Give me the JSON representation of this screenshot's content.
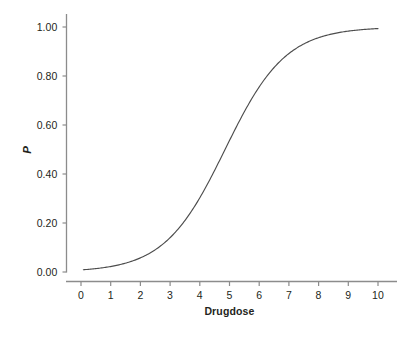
{
  "chart_data": {
    "type": "line",
    "title": "",
    "subtitle": "",
    "xlabel": "Drugdose",
    "ylabel": "P",
    "xlim": [
      -0.35,
      10.55
    ],
    "ylim": [
      -0.045,
      1.045
    ],
    "xticks": [
      0,
      1,
      2,
      3,
      4,
      5,
      6,
      7,
      8,
      9,
      10
    ],
    "xticklabels": [
      "0",
      "1",
      "2",
      "3",
      "4",
      "5",
      "6",
      "7",
      "8",
      "9",
      "10"
    ],
    "yticks": [
      0.0,
      0.2,
      0.4,
      0.6,
      0.8,
      1.0
    ],
    "yticklabels": [
      "0.00",
      "0.20",
      "0.40",
      "0.60",
      "0.80",
      "1.00"
    ],
    "grid": false,
    "legend": "none",
    "series": [
      {
        "name": "logistic response",
        "color": "#4d4d4d",
        "line_width": 1.0,
        "x": [
          0.08,
          0.3,
          0.6,
          0.9,
          1.2,
          1.5,
          1.8,
          2.1,
          2.4,
          2.7,
          3.0,
          3.3,
          3.6,
          3.9,
          4.2,
          4.5,
          4.85,
          5.2,
          5.5,
          5.8,
          6.1,
          6.4,
          6.7,
          7.0,
          7.3,
          7.6,
          7.9,
          8.2,
          8.5,
          8.8,
          9.1,
          9.4,
          9.7,
          10.0
        ],
        "values": [
          0.008,
          0.01,
          0.014,
          0.018,
          0.025,
          0.033,
          0.044,
          0.059,
          0.078,
          0.102,
          0.133,
          0.171,
          0.217,
          0.271,
          0.333,
          0.402,
          0.5,
          0.595,
          0.67,
          0.737,
          0.794,
          0.842,
          0.88,
          0.909,
          0.932,
          0.949,
          0.962,
          0.972,
          0.979,
          0.984,
          0.988,
          0.991,
          0.993,
          0.993
        ]
      }
    ],
    "model": {
      "form": "logistic",
      "midpoint_dose": 4.85,
      "scale": 1.02,
      "p_min": 0.008,
      "p_max": 0.993
    }
  },
  "axes": {
    "background_color": "#ffffff",
    "axis_color": "#808080",
    "text_color": "#231f20"
  }
}
